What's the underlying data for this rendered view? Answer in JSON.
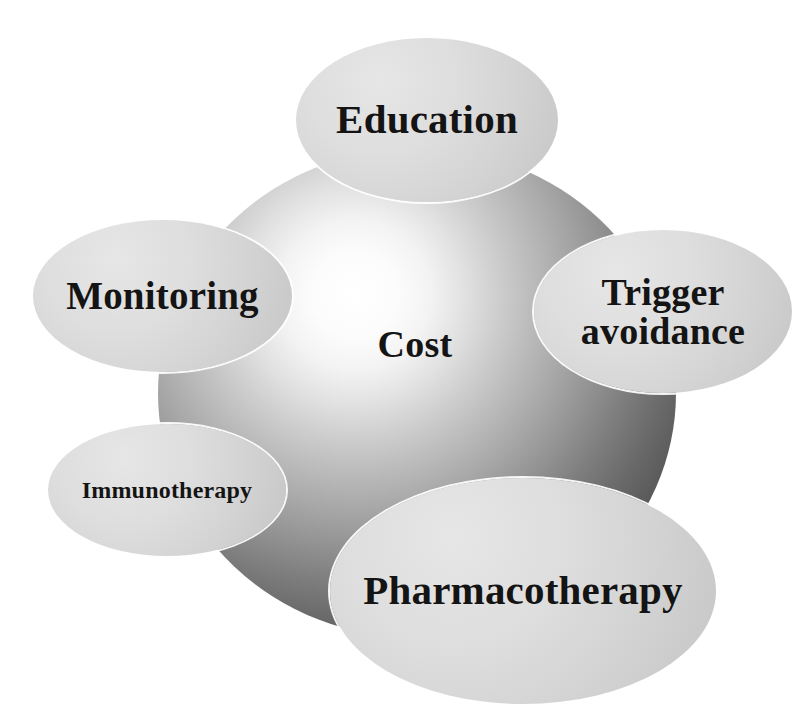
{
  "diagram": {
    "title": "Cost",
    "center": {
      "label": "Cost",
      "shape": "sphere",
      "fill_highlight": "#ffffff",
      "fill_shadow": "#3a3a3a"
    },
    "nodes": [
      {
        "id": "education",
        "label": "Education",
        "shape": "ellipse",
        "fill": "#d4d4d4",
        "text_color": "#141414",
        "position": "top"
      },
      {
        "id": "monitoring",
        "label": "Monitoring",
        "shape": "ellipse",
        "fill": "#d4d4d4",
        "text_color": "#141414",
        "position": "left"
      },
      {
        "id": "trigger",
        "label": "Trigger avoidance",
        "shape": "ellipse",
        "fill": "#d4d4d4",
        "text_color": "#141414",
        "position": "right",
        "line1": "Trigger",
        "line2": "avoidance"
      },
      {
        "id": "immunotherapy",
        "label": "Immunotherapy",
        "shape": "ellipse",
        "fill": "#d4d4d4",
        "text_color": "#141414",
        "position": "lower-left"
      },
      {
        "id": "pharmacotherapy",
        "label": "Pharmacotherapy",
        "shape": "ellipse",
        "fill": "#d4d4d4",
        "text_color": "#141414",
        "position": "bottom"
      }
    ]
  }
}
